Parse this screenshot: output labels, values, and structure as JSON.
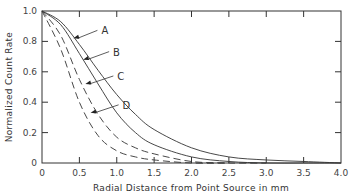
{
  "chart_data": {
    "type": "line",
    "title": "",
    "xlabel": "Radial Distance from Point Source in mm",
    "ylabel": "Normalized Count Rate",
    "xlim": [
      0,
      4.0
    ],
    "ylim": [
      0,
      1.0
    ],
    "xticks": [
      "0",
      "0.5",
      "1.0",
      "1.5",
      "2.0",
      "2.5",
      "3.0",
      "3.5",
      "4.0"
    ],
    "yticks": [
      "0",
      "0.2",
      "0.4",
      "0.6",
      "0.8",
      "1.0"
    ],
    "grid": false,
    "legend": "inline arrow labels",
    "series": [
      {
        "name": "A",
        "style": "solid",
        "x": [
          0,
          0.25,
          0.5,
          0.75,
          1.0,
          1.25,
          1.5,
          2.0,
          2.5,
          3.0,
          3.5,
          4.0
        ],
        "values": [
          1.0,
          0.93,
          0.78,
          0.61,
          0.45,
          0.32,
          0.22,
          0.1,
          0.04,
          0.02,
          0.01,
          0.0
        ]
      },
      {
        "name": "B",
        "style": "solid",
        "x": [
          0,
          0.25,
          0.5,
          0.75,
          1.0,
          1.25,
          1.5,
          2.0,
          2.5,
          3.0,
          3.5,
          4.0
        ],
        "values": [
          1.0,
          0.91,
          0.72,
          0.52,
          0.33,
          0.2,
          0.12,
          0.04,
          0.01,
          0.0,
          0.0,
          0.0
        ]
      },
      {
        "name": "C",
        "style": "dashed",
        "x": [
          0,
          0.25,
          0.5,
          0.75,
          1.0,
          1.25,
          1.5,
          2.0,
          2.5,
          3.0
        ],
        "values": [
          1.0,
          0.84,
          0.55,
          0.32,
          0.17,
          0.1,
          0.06,
          0.01,
          0.0,
          0.0
        ]
      },
      {
        "name": "D",
        "style": "dashed",
        "x": [
          0,
          0.25,
          0.5,
          0.75,
          1.0,
          1.25,
          1.5,
          2.0,
          2.5
        ],
        "values": [
          1.0,
          0.75,
          0.4,
          0.18,
          0.08,
          0.04,
          0.02,
          0.0,
          0.0
        ]
      }
    ],
    "annotations": [
      {
        "text": "A",
        "arrow_to": [
          0.42,
          0.82
        ]
      },
      {
        "text": "B",
        "arrow_to": [
          0.55,
          0.68
        ]
      },
      {
        "text": "C",
        "arrow_to": [
          0.58,
          0.52
        ]
      },
      {
        "text": "D",
        "arrow_to": [
          0.65,
          0.33
        ]
      }
    ]
  }
}
